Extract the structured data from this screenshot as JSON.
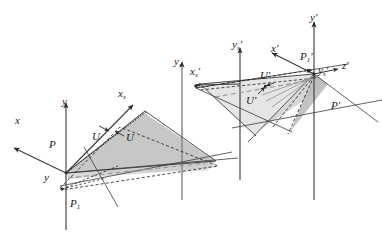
{
  "figure": {
    "background_color": "#ffffff",
    "line_color": "#3a3a3a",
    "fill_color": "#c9c9c9",
    "fill_color_light": "#dcdcdc",
    "dash_color": "#2b2b2b"
  },
  "left_frame": {
    "labels": {
      "axis_x": "x",
      "axis_y": "y",
      "axis_xs": "x",
      "axis_xs_sub": "s",
      "axis_ys": "y",
      "axis_ys_sub": "s",
      "point_p": "P",
      "point_p1": "P",
      "point_p1_sub": "1",
      "point_y_low": "y",
      "vector_u_left": "U",
      "vector_u_right": "U"
    }
  },
  "right_frame": {
    "labels": {
      "axis_x_prime": "x′",
      "axis_y_prime": "y′",
      "axis_z_prime": "z′",
      "axis_xs_prime": "x",
      "axis_xs_prime_sub": "s",
      "axis_ys_prime_left": "y",
      "axis_ys_prime_left_sub": "s",
      "axis_ys_prime_right": "y",
      "axis_ys_prime_right_sub": "s",
      "point_p_prime": "P′",
      "point_p1_prime": "P",
      "point_p1_prime_sub": "1",
      "vector_u_prime_upper": "U′",
      "vector_u_prime_lower": "U′"
    }
  }
}
